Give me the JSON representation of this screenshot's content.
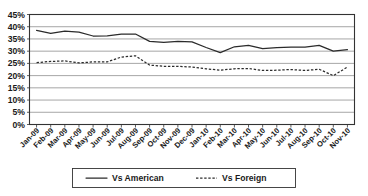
{
  "chart_data": {
    "type": "line",
    "title": "",
    "subtitle": "",
    "xlabel": "",
    "ylabel": "",
    "ylim": [
      0,
      45
    ],
    "ytick_step": 5,
    "grid": true,
    "legend_position": "bottom",
    "categories": [
      "Jan-09",
      "Feb-09",
      "Mar-09",
      "Apr-09",
      "May-09",
      "Jun-09",
      "Jul-09",
      "Aug-09",
      "Sep-09",
      "Oct-09",
      "Nov-09",
      "Dec-09",
      "Jan-10",
      "Feb-10",
      "Mar-10",
      "Apr-10",
      "May-10",
      "Jun-10",
      "Jul-10",
      "Aug-10",
      "Sep-10",
      "Oct-10",
      "Nov-10"
    ],
    "ytick_labels": [
      "0%",
      "5%",
      "10%",
      "15%",
      "20%",
      "25%",
      "30%",
      "35%",
      "40%",
      "45%"
    ],
    "ytick_values": [
      0,
      5,
      10,
      15,
      20,
      25,
      30,
      35,
      40,
      45
    ],
    "series": [
      {
        "name": "Vs American",
        "style": "solid",
        "color": "#2b2b2b",
        "values": [
          38.5,
          37.3,
          38.2,
          37.8,
          36.2,
          36.3,
          37.0,
          37.0,
          34.0,
          33.6,
          34.0,
          33.8,
          31.5,
          29.4,
          31.8,
          32.4,
          31.0,
          31.4,
          31.7,
          31.7,
          32.4,
          30.0,
          30.6
        ]
      },
      {
        "name": "Vs Foreign",
        "style": "dashed",
        "color": "#2b2b2b",
        "values": [
          25.3,
          25.8,
          26.0,
          25.2,
          25.6,
          25.6,
          27.6,
          28.1,
          24.3,
          23.8,
          23.8,
          23.5,
          22.8,
          22.2,
          22.8,
          22.9,
          22.1,
          22.2,
          22.5,
          22.1,
          22.6,
          20.0,
          23.5
        ]
      }
    ]
  },
  "legend": {
    "items": [
      {
        "label": "Vs American",
        "style": "solid"
      },
      {
        "label": "Vs Foreign",
        "style": "dashed"
      }
    ]
  }
}
